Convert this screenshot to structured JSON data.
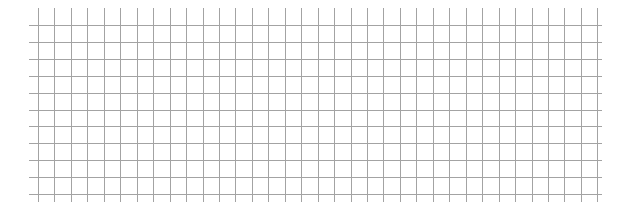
{
  "canvas": {
    "width": 630,
    "height": 214,
    "background": "#ffffff"
  },
  "grid": {
    "line_color": "#a3a3a3",
    "line_width": 1,
    "vertical": {
      "x_start": 38,
      "spacing": 16.45,
      "count": 35,
      "y_top": 8,
      "y_bottom": 202
    },
    "horizontal": {
      "y_start": 25,
      "spacing": 16.9,
      "count": 11,
      "x_left": 29,
      "x_right": 602
    }
  }
}
